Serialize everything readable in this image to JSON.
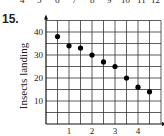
{
  "problem_number": "15.",
  "top_strip_numbers": [
    "4",
    "5",
    "6",
    "7",
    "8",
    "9",
    "10",
    "11",
    "12"
  ],
  "chart_data": {
    "type": "scatter",
    "title": "",
    "xlabel": "",
    "ylabel": "Insects landing",
    "x_ticks": [
      "1",
      "2",
      "3",
      "4"
    ],
    "y_ticks": [
      "10",
      "20",
      "30",
      "40"
    ],
    "xlim": [
      0,
      5
    ],
    "ylim": [
      0,
      45
    ],
    "grid": true,
    "x": [
      0.5,
      1,
      1.5,
      2,
      2.5,
      3,
      3.5,
      4,
      4.5
    ],
    "y": [
      38,
      34,
      33,
      30,
      27,
      25,
      20,
      16,
      14
    ]
  }
}
